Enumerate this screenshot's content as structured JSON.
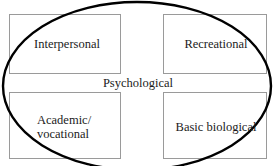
{
  "diagram": {
    "kind": "four-quadrant-with-overlay-ellipse",
    "overlay": {
      "name": "psychological-domain-ellipse",
      "label": "Psychological",
      "stroke_color": "#000000",
      "stroke_width_px": 2.4,
      "center_x": 137,
      "center_y": 86,
      "radius_x": 134,
      "radius_y": 84
    },
    "box_border_color": "#9a9a9a",
    "text_color": "#1b1b1b",
    "background_color": "#ffffff",
    "quadrants": [
      {
        "id": "interpersonal",
        "label": "Interpersonal",
        "position": "top-left"
      },
      {
        "id": "recreational",
        "label": "Recreational",
        "position": "top-right"
      },
      {
        "id": "academic-vocational",
        "label": "Academic/\nvocational",
        "position": "bottom-left"
      },
      {
        "id": "basic-biological",
        "label": "Basic biological",
        "position": "bottom-right"
      }
    ]
  }
}
